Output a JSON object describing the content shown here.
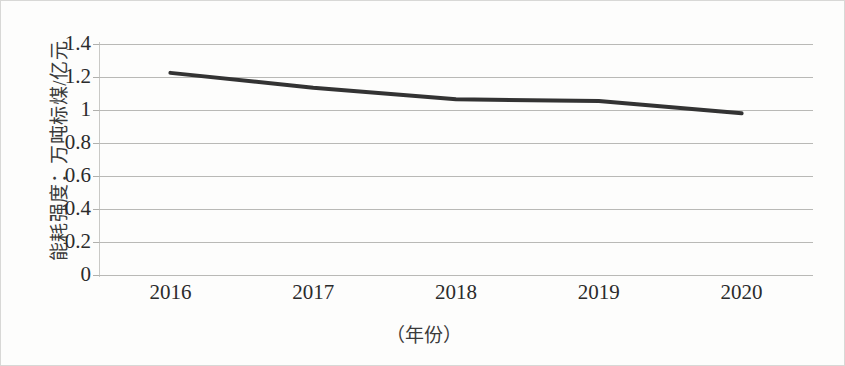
{
  "chart_data": {
    "type": "line",
    "title": "",
    "xlabel": "（年份）",
    "ylabel": "能耗强度：万吨标煤/亿元",
    "categories": [
      "2016",
      "2017",
      "2018",
      "2019",
      "2020"
    ],
    "x": [
      2016,
      2017,
      2018,
      2019,
      2020
    ],
    "series": [
      {
        "name": "能耗强度",
        "values": [
          1.225,
          1.135,
          1.065,
          1.055,
          0.98
        ],
        "color": "#333333",
        "line_width": 4
      }
    ],
    "ylim": [
      0,
      1.4
    ],
    "y_ticks": [
      1.4,
      1.2,
      1,
      0.8,
      0.6,
      0.4,
      0.2,
      0
    ],
    "y_tick_labels": [
      "1.4",
      "1.2",
      "1",
      "0.8",
      "0.6",
      "0.4",
      "0.2",
      "0"
    ],
    "grid": true,
    "grid_color": "#b9b9b6",
    "legend": false,
    "legend_position": "none",
    "background": "#fdfdfc",
    "markers": false
  },
  "axes": {
    "y_title": "能耗强度：万吨标煤/亿元",
    "x_title": "（年份）"
  }
}
